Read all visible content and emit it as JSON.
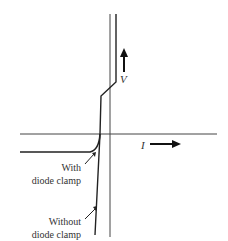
{
  "diagram": {
    "axis_labels": {
      "vertical": "V",
      "horizontal": "I"
    },
    "annotations": {
      "with_clamp": [
        "With",
        "diode clamp"
      ],
      "without_clamp": [
        "Without",
        "diode clamp"
      ]
    },
    "colors": {
      "line": "#222222",
      "background": "#ffffff"
    }
  }
}
